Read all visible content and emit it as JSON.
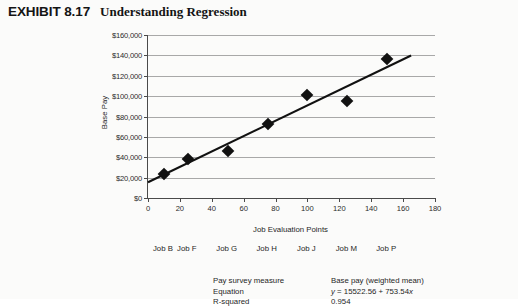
{
  "header": {
    "exhibit_label": "EXHIBIT 8.17",
    "title": "Understanding Regression"
  },
  "chart_data": {
    "type": "scatter",
    "title": "Understanding Regression",
    "xlabel": "Job Evaluation Points",
    "ylabel": "Base Pay",
    "xlim": [
      0,
      180
    ],
    "ylim": [
      0,
      160000
    ],
    "xticks": [
      0,
      20,
      40,
      60,
      80,
      100,
      120,
      140,
      160,
      180
    ],
    "xtick_labels": [
      "0",
      "20",
      "40",
      "60",
      "80",
      "100",
      "120",
      "140",
      "160",
      "180"
    ],
    "yticks": [
      0,
      20000,
      40000,
      60000,
      80000,
      100000,
      120000,
      140000,
      160000
    ],
    "ytick_labels": [
      "$0",
      "$20,000",
      "$40,000",
      "$60,000",
      "$80,000",
      "$100,000",
      "$120,000",
      "$140,000",
      "$160,000"
    ],
    "grid": "horizontal",
    "legend": "none",
    "point_labels": [
      "Job B",
      "Job F",
      "Job G",
      "Job H",
      "Job J",
      "Job M",
      "Job P"
    ],
    "points": [
      {
        "label": "Job B",
        "x": 10,
        "y": 24000
      },
      {
        "label": "Job F",
        "x": 25,
        "y": 38000
      },
      {
        "label": "Job G",
        "x": 50,
        "y": 46000
      },
      {
        "label": "Job H",
        "x": 75,
        "y": 73000
      },
      {
        "label": "Job J",
        "x": 100,
        "y": 101000
      },
      {
        "label": "Job M",
        "x": 125,
        "y": 95000
      },
      {
        "label": "Job P",
        "x": 150,
        "y": 136000
      }
    ],
    "trendline": {
      "intercept": 15522.56,
      "slope": 753.54,
      "x_start": 0,
      "x_end": 165
    }
  },
  "stats": {
    "rows": [
      {
        "key": "Pay survey measure",
        "value": "Base pay (weighted mean)"
      },
      {
        "key": "Equation",
        "value": "y = 15522.56 +  753.54x"
      },
      {
        "key": "R-squared",
        "value": "0.954"
      }
    ]
  }
}
